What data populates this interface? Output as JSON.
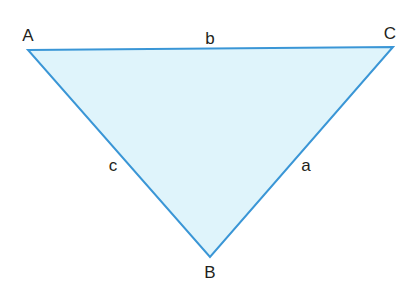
{
  "diagram": {
    "type": "triangle",
    "fill_color": "#dff4fb",
    "stroke_color": "#3a96d6",
    "label_color": "#231f20",
    "vertices": [
      {
        "name": "A",
        "x": 28,
        "y": 50,
        "label_x": 28,
        "label_y": 41
      },
      {
        "name": "B",
        "x": 210,
        "y": 257,
        "label_x": 210,
        "label_y": 278
      },
      {
        "name": "C",
        "x": 393,
        "y": 47,
        "label_x": 390,
        "label_y": 39
      }
    ],
    "sides": [
      {
        "name": "b",
        "between": "A-C",
        "label_x": 210,
        "label_y": 44
      },
      {
        "name": "c",
        "between": "A-B",
        "label_x": 113,
        "label_y": 171
      },
      {
        "name": "a",
        "between": "B-C",
        "label_x": 306,
        "label_y": 171
      }
    ]
  },
  "labels": {
    "A": "A",
    "B": "B",
    "C": "C",
    "a": "a",
    "b": "b",
    "c": "c"
  }
}
